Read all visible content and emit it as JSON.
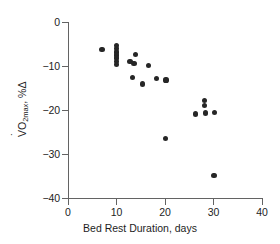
{
  "chart_data": {
    "type": "scatter",
    "title": "",
    "xlabel": "Bed Rest Duration, days",
    "ylabel": "VO2max, %Δ",
    "ylabel_parts": {
      "v": "V",
      "o": "O",
      "sub": "2max",
      "suffix": ", %Δ"
    },
    "xlim": [
      0,
      40
    ],
    "ylim": [
      -40,
      0
    ],
    "xticks": [
      0,
      10,
      20,
      30,
      40
    ],
    "yticks": [
      0,
      -10,
      -20,
      -30,
      -40
    ],
    "xticklabels": [
      "0",
      "10",
      "20",
      "30",
      "40"
    ],
    "yticklabels": [
      "0",
      "−10",
      "−20",
      "−30",
      "−40"
    ],
    "grid": false,
    "legend": false,
    "marker": "filled-circle",
    "marker_color": "#262626",
    "axis_color": "#636363",
    "background": "#ffffff",
    "points": [
      {
        "x": 7.0,
        "y": -6.2
      },
      {
        "x": 10.0,
        "y": -5.4
      },
      {
        "x": 10.0,
        "y": -6.1
      },
      {
        "x": 10.0,
        "y": -6.8
      },
      {
        "x": 10.0,
        "y": -7.5
      },
      {
        "x": 10.0,
        "y": -8.2
      },
      {
        "x": 10.0,
        "y": -8.9
      },
      {
        "x": 10.0,
        "y": -9.6
      },
      {
        "x": 12.8,
        "y": -9.0
      },
      {
        "x": 14.0,
        "y": -7.3
      },
      {
        "x": 13.6,
        "y": -9.5
      },
      {
        "x": 13.3,
        "y": -12.6
      },
      {
        "x": 15.3,
        "y": -14.1
      },
      {
        "x": 16.6,
        "y": -9.9
      },
      {
        "x": 18.2,
        "y": -12.8
      },
      {
        "x": 20.2,
        "y": -13.2
      },
      {
        "x": 20.1,
        "y": -26.5
      },
      {
        "x": 26.3,
        "y": -20.9
      },
      {
        "x": 28.2,
        "y": -17.9
      },
      {
        "x": 28.2,
        "y": -18.9
      },
      {
        "x": 28.3,
        "y": -20.7
      },
      {
        "x": 30.2,
        "y": -20.5
      },
      {
        "x": 30.1,
        "y": -34.8
      }
    ]
  }
}
